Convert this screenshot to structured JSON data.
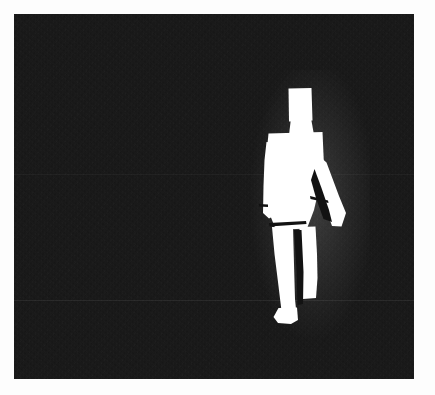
{
  "image": {
    "kind": "binary-silhouette-frame",
    "title": "Pedestrian silhouette on dark background",
    "width_px": 435,
    "height_px": 395,
    "margin_color": "#fdfdfd",
    "background_color": "#121212",
    "foreground_color": "#ffffff",
    "noise": "film-grain"
  },
  "scene": {
    "name": "dark-frame",
    "left_px": 14,
    "top_px": 14,
    "width_px": 400,
    "height_px": 365
  },
  "subject": {
    "label": "walking-person-silhouette",
    "description": "White binary blob of a walking human figure, right of frame center",
    "parts": [
      {
        "name": "head",
        "shape": "rectangle",
        "x": 288,
        "y": 88,
        "width": 23,
        "height": 33
      },
      {
        "name": "torso",
        "shape": "polygon",
        "x": 267,
        "y": 133,
        "width": 56,
        "height": 95
      },
      {
        "name": "left-arm",
        "shape": "polygon",
        "x": 265,
        "y": 150,
        "width": 16,
        "height": 70
      },
      {
        "name": "right-arm",
        "shape": "polygon",
        "x": 305,
        "y": 165,
        "width": 34,
        "height": 75
      },
      {
        "name": "left-leg",
        "shape": "polygon",
        "x": 272,
        "y": 228,
        "width": 22,
        "height": 95
      },
      {
        "name": "right-leg",
        "shape": "polygon",
        "x": 297,
        "y": 228,
        "width": 22,
        "height": 72
      },
      {
        "name": "left-foot",
        "shape": "polygon",
        "x": 270,
        "y": 308,
        "width": 26,
        "height": 15
      }
    ]
  },
  "annotations": {
    "scanline_count": 2,
    "bloom": "soft-white-halo"
  }
}
